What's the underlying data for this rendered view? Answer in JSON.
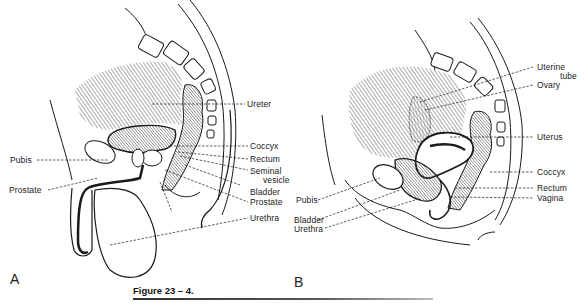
{
  "figure": {
    "caption": "Figure 23 – 4.",
    "panels": [
      {
        "id": "A",
        "letter": "A",
        "subject": "male pelvis sagittal section",
        "labels_right": [
          "Ureter",
          "Coccyx",
          "Rectum",
          "Seminal",
          "vesicle",
          "Bladder",
          "Prostate",
          "Urethra"
        ],
        "labels_left": [
          "Pubis",
          "Prostate"
        ]
      },
      {
        "id": "B",
        "letter": "B",
        "subject": "female pelvis sagittal section",
        "labels_right": [
          "Uterine",
          "tube",
          "Ovary",
          "Uterus",
          "Coccyx",
          "Rectum",
          "Vagina"
        ],
        "labels_left": [
          "Pubis",
          "Bladder",
          "Urethra"
        ]
      }
    ]
  },
  "colors": {
    "ink": "#1a1a1a",
    "hatch": "#6a6a6a",
    "shaded": "#9a9a9a",
    "paper": "#ffffff"
  }
}
